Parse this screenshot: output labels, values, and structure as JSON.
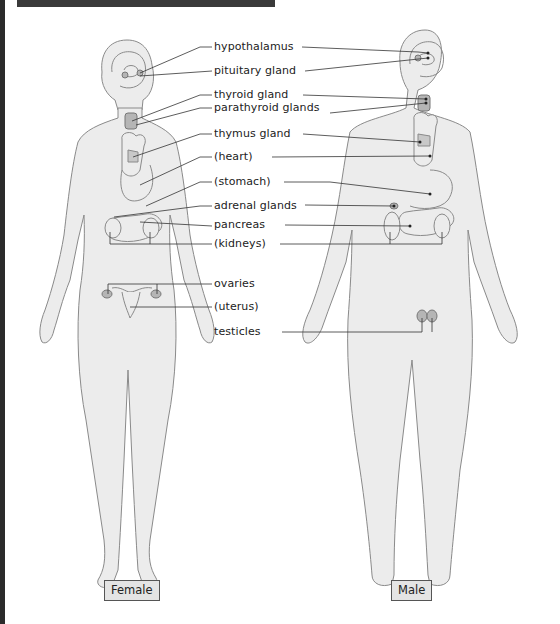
{
  "diagram": {
    "type": "endocrine system anatomy",
    "colors": {
      "body_fill": "#ececec",
      "body_stroke": "#8a8a8a",
      "gland_fill": "#b5b5b5",
      "leader_line": "#333333",
      "frame": "#2b2b2b"
    },
    "labels": [
      {
        "id": "hypothalamus",
        "text": "hypothalamus"
      },
      {
        "id": "pituitary",
        "text": "pituitary gland"
      },
      {
        "id": "thyroid",
        "text": "thyroid gland"
      },
      {
        "id": "parathyroid",
        "text": "parathyroid glands"
      },
      {
        "id": "thymus",
        "text": "thymus gland"
      },
      {
        "id": "heart",
        "text": "(heart)"
      },
      {
        "id": "stomach",
        "text": "(stomach)"
      },
      {
        "id": "adrenal",
        "text": "adrenal glands"
      },
      {
        "id": "pancreas",
        "text": "pancreas"
      },
      {
        "id": "kidneys",
        "text": "(kidneys)"
      },
      {
        "id": "ovaries",
        "text": "ovaries"
      },
      {
        "id": "uterus",
        "text": "(uterus)"
      },
      {
        "id": "testicles",
        "text": "testicles"
      }
    ],
    "figures": {
      "female": "Female",
      "male": "Male"
    }
  }
}
